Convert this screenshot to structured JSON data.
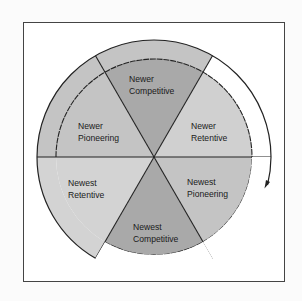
{
  "diagram": {
    "type": "cycle-wheel",
    "direction": "clockwise",
    "colors": {
      "background": "#fbfbfb",
      "frame": "#444444",
      "dark": "#a9a9a9",
      "medium": "#c4c4c4",
      "light": "#d3d3d3",
      "line": "#222222"
    },
    "segments": [
      {
        "id": "newer-competitive",
        "line1": "Newer",
        "line2": "Competitive"
      },
      {
        "id": "newer-retentive",
        "line1": "Newer",
        "line2": "Retentive"
      },
      {
        "id": "newest-pioneering",
        "line1": "Newest",
        "line2": "Pioneering"
      },
      {
        "id": "newest-competitive",
        "line1": "Newest",
        "line2": "Competitive"
      },
      {
        "id": "newest-retentive",
        "line1": "Newest",
        "line2": "Retentive"
      },
      {
        "id": "newer-pioneering",
        "line1": "Newer",
        "line2": "Pioneering"
      }
    ]
  }
}
